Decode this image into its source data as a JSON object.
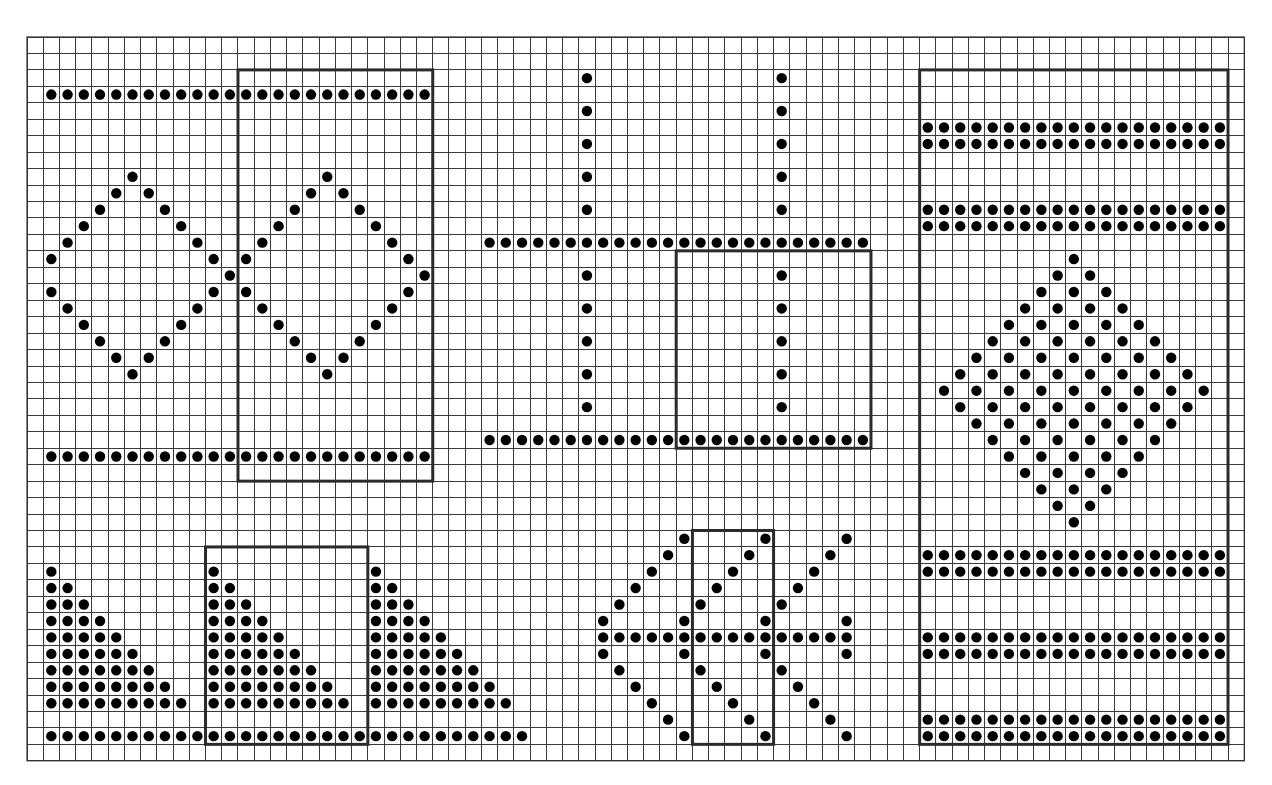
{
  "chart_data": {
    "type": "stitch-chart",
    "title": "",
    "grid": {
      "columns": 75,
      "rows": 44,
      "origin_px": [
        27,
        37
      ],
      "cell_px": [
        16.23,
        16.45
      ],
      "line_color": "#3a3a3a",
      "box_color": "#2b2b2b",
      "dot_color": "#000000",
      "background": "#ffffff"
    },
    "legend": [],
    "motifs": [
      {
        "name": "double-diamond-lattice",
        "repeat_box": {
          "col_start": 13,
          "col_end": 24,
          "row_start": 2,
          "row_end": 26
        },
        "dots": [
          [
            3,
            [
              1,
              2,
              3,
              4,
              5,
              6,
              7,
              8,
              9,
              10,
              11,
              12,
              13,
              14,
              15,
              16,
              17,
              18,
              19,
              20,
              21,
              22,
              23,
              24
            ]
          ],
          [
            8,
            [
              6,
              18
            ]
          ],
          [
            9,
            [
              5,
              7,
              17,
              19
            ]
          ],
          [
            10,
            [
              4,
              8,
              16,
              20
            ]
          ],
          [
            11,
            [
              3,
              9,
              15,
              21
            ]
          ],
          [
            12,
            [
              2,
              10,
              14,
              22
            ]
          ],
          [
            13,
            [
              1,
              11,
              13,
              23
            ]
          ],
          [
            14,
            [
              12,
              24
            ]
          ],
          [
            15,
            [
              1,
              11,
              13,
              23
            ]
          ],
          [
            16,
            [
              2,
              10,
              14,
              22
            ]
          ],
          [
            17,
            [
              3,
              9,
              15,
              21
            ]
          ],
          [
            18,
            [
              4,
              8,
              16,
              20
            ]
          ],
          [
            19,
            [
              5,
              7,
              17,
              19
            ]
          ],
          [
            20,
            [
              6,
              18
            ]
          ],
          [
            25,
            [
              1,
              2,
              3,
              4,
              5,
              6,
              7,
              8,
              9,
              10,
              11,
              12,
              13,
              14,
              15,
              16,
              17,
              18,
              19,
              20,
              21,
              22,
              23,
              24
            ]
          ]
        ]
      },
      {
        "name": "window-pane-grid",
        "repeat_box": {
          "col_start": 40,
          "col_end": 51,
          "row_start": 13,
          "row_end": 24
        },
        "dots": [
          [
            2,
            [
              34,
              46
            ]
          ],
          [
            4,
            [
              34,
              46
            ]
          ],
          [
            6,
            [
              34,
              46
            ]
          ],
          [
            8,
            [
              34,
              46
            ]
          ],
          [
            10,
            [
              34,
              46
            ]
          ],
          [
            12,
            [
              28,
              29,
              30,
              31,
              32,
              33,
              34,
              35,
              36,
              37,
              38,
              39,
              40,
              41,
              42,
              43,
              44,
              45,
              46,
              47,
              48,
              49,
              50,
              51
            ]
          ],
          [
            14,
            [
              34,
              46
            ]
          ],
          [
            16,
            [
              34,
              46
            ]
          ],
          [
            18,
            [
              34,
              46
            ]
          ],
          [
            20,
            [
              34,
              46
            ]
          ],
          [
            22,
            [
              34,
              46
            ]
          ],
          [
            24,
            [
              28,
              29,
              30,
              31,
              32,
              33,
              34,
              35,
              36,
              37,
              38,
              39,
              40,
              41,
              42,
              43,
              44,
              45,
              46,
              47,
              48,
              49,
              50,
              51
            ]
          ]
        ]
      },
      {
        "name": "banded-filled-diamond",
        "repeat_box": {
          "col_start": 55,
          "col_end": 73,
          "row_start": 2,
          "row_end": 42
        },
        "dots": [
          [
            5,
            [
              55,
              56,
              57,
              58,
              59,
              60,
              61,
              62,
              63,
              64,
              65,
              66,
              67,
              68,
              69,
              70,
              71,
              72,
              73
            ]
          ],
          [
            6,
            [
              55,
              56,
              57,
              58,
              59,
              60,
              61,
              62,
              63,
              64,
              65,
              66,
              67,
              68,
              69,
              70,
              71,
              72,
              73
            ]
          ],
          [
            10,
            [
              55,
              56,
              57,
              58,
              59,
              60,
              61,
              62,
              63,
              64,
              65,
              66,
              67,
              68,
              69,
              70,
              71,
              72,
              73
            ]
          ],
          [
            11,
            [
              55,
              56,
              57,
              58,
              59,
              60,
              61,
              62,
              63,
              64,
              65,
              66,
              67,
              68,
              69,
              70,
              71,
              72,
              73
            ]
          ],
          [
            13,
            [
              64
            ]
          ],
          [
            14,
            [
              63,
              65
            ]
          ],
          [
            15,
            [
              62,
              64,
              66
            ]
          ],
          [
            16,
            [
              61,
              63,
              65,
              67
            ]
          ],
          [
            17,
            [
              60,
              62,
              64,
              66,
              68
            ]
          ],
          [
            18,
            [
              59,
              61,
              63,
              65,
              67,
              69
            ]
          ],
          [
            19,
            [
              58,
              60,
              62,
              64,
              66,
              68,
              70
            ]
          ],
          [
            20,
            [
              57,
              59,
              61,
              63,
              65,
              67,
              69,
              71
            ]
          ],
          [
            21,
            [
              56,
              58,
              60,
              62,
              64,
              66,
              68,
              70,
              72
            ]
          ],
          [
            22,
            [
              57,
              59,
              61,
              63,
              65,
              67,
              69,
              71
            ]
          ],
          [
            23,
            [
              58,
              60,
              62,
              64,
              66,
              68,
              70
            ]
          ],
          [
            24,
            [
              59,
              61,
              63,
              65,
              67,
              69
            ]
          ],
          [
            25,
            [
              60,
              62,
              64,
              66,
              68
            ]
          ],
          [
            26,
            [
              61,
              63,
              65,
              67
            ]
          ],
          [
            27,
            [
              62,
              64,
              66
            ]
          ],
          [
            28,
            [
              63,
              65
            ]
          ],
          [
            29,
            [
              64
            ]
          ],
          [
            31,
            [
              55,
              56,
              57,
              58,
              59,
              60,
              61,
              62,
              63,
              64,
              65,
              66,
              67,
              68,
              69,
              70,
              71,
              72,
              73
            ]
          ],
          [
            32,
            [
              55,
              56,
              57,
              58,
              59,
              60,
              61,
              62,
              63,
              64,
              65,
              66,
              67,
              68,
              69,
              70,
              71,
              72,
              73
            ]
          ],
          [
            36,
            [
              55,
              56,
              57,
              58,
              59,
              60,
              61,
              62,
              63,
              64,
              65,
              66,
              67,
              68,
              69,
              70,
              71,
              72,
              73
            ]
          ],
          [
            37,
            [
              55,
              56,
              57,
              58,
              59,
              60,
              61,
              62,
              63,
              64,
              65,
              66,
              67,
              68,
              69,
              70,
              71,
              72,
              73
            ]
          ],
          [
            41,
            [
              55,
              56,
              57,
              58,
              59,
              60,
              61,
              62,
              63,
              64,
              65,
              66,
              67,
              68,
              69,
              70,
              71,
              72,
              73
            ]
          ],
          [
            42,
            [
              55,
              56,
              57,
              58,
              59,
              60,
              61,
              62,
              63,
              64,
              65,
              66,
              67,
              68,
              69,
              70,
              71,
              72,
              73
            ]
          ]
        ]
      },
      {
        "name": "stepped-triangles",
        "repeat_box": {
          "col_start": 11,
          "col_end": 20,
          "row_start": 31,
          "row_end": 42
        },
        "dots": [
          [
            32,
            [
              1,
              11,
              21
            ]
          ],
          [
            33,
            [
              1,
              2,
              11,
              12,
              21,
              22
            ]
          ],
          [
            34,
            [
              1,
              2,
              3,
              11,
              12,
              13,
              21,
              22,
              23
            ]
          ],
          [
            35,
            [
              1,
              2,
              3,
              4,
              11,
              12,
              13,
              14,
              21,
              22,
              23,
              24
            ]
          ],
          [
            36,
            [
              1,
              2,
              3,
              4,
              5,
              11,
              12,
              13,
              14,
              15,
              21,
              22,
              23,
              24,
              25
            ]
          ],
          [
            37,
            [
              1,
              2,
              3,
              4,
              5,
              6,
              11,
              12,
              13,
              14,
              15,
              16,
              21,
              22,
              23,
              24,
              25,
              26
            ]
          ],
          [
            38,
            [
              1,
              2,
              3,
              4,
              5,
              6,
              7,
              11,
              12,
              13,
              14,
              15,
              16,
              17,
              21,
              22,
              23,
              24,
              25,
              26,
              27
            ]
          ],
          [
            39,
            [
              1,
              2,
              3,
              4,
              5,
              6,
              7,
              8,
              11,
              12,
              13,
              14,
              15,
              16,
              17,
              18,
              21,
              22,
              23,
              24,
              25,
              26,
              27,
              28
            ]
          ],
          [
            40,
            [
              1,
              2,
              3,
              4,
              5,
              6,
              7,
              8,
              9,
              11,
              12,
              13,
              14,
              15,
              16,
              17,
              18,
              19,
              21,
              22,
              23,
              24,
              25,
              26,
              27,
              28,
              29
            ]
          ],
          [
            42,
            [
              1,
              2,
              3,
              4,
              5,
              6,
              7,
              8,
              9,
              10,
              11,
              12,
              13,
              14,
              15,
              16,
              17,
              18,
              19,
              20,
              21,
              22,
              23,
              24,
              25,
              26,
              27,
              28,
              29,
              30
            ]
          ]
        ]
      },
      {
        "name": "chevron-arrows",
        "repeat_box": {
          "col_start": 41,
          "col_end": 45,
          "row_start": 30,
          "row_end": 42
        },
        "dots": [
          [
            30,
            [
              40,
              45,
              50
            ]
          ],
          [
            31,
            [
              39,
              44,
              49
            ]
          ],
          [
            32,
            [
              38,
              43,
              48
            ]
          ],
          [
            33,
            [
              37,
              42,
              47
            ]
          ],
          [
            34,
            [
              36,
              41,
              46
            ]
          ],
          [
            35,
            [
              35,
              40,
              45,
              50
            ]
          ],
          [
            36,
            [
              35,
              36,
              37,
              38,
              39,
              40,
              41,
              42,
              43,
              44,
              45,
              46,
              47,
              48,
              49,
              50
            ]
          ],
          [
            37,
            [
              35,
              40,
              45,
              50
            ]
          ],
          [
            38,
            [
              36,
              41,
              46
            ]
          ],
          [
            39,
            [
              37,
              42,
              47
            ]
          ],
          [
            40,
            [
              38,
              43,
              48
            ]
          ],
          [
            41,
            [
              39,
              44,
              49
            ]
          ],
          [
            42,
            [
              40,
              45,
              50
            ]
          ]
        ]
      }
    ]
  }
}
